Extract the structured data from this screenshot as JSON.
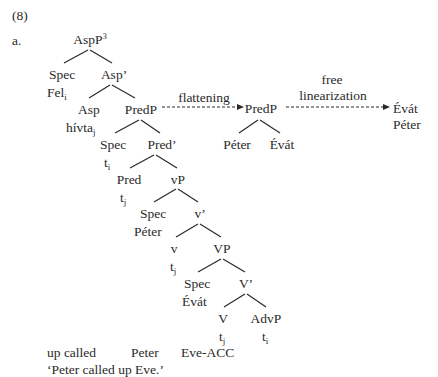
{
  "example": {
    "number": "(8)",
    "sub_label": "a."
  },
  "tree": {
    "root": {
      "label": "AspP",
      "sup": "3"
    },
    "spec1": {
      "label": "Spec",
      "filler": "Fel",
      "filler_sub": "i"
    },
    "asp_bar": {
      "label": "Asp’"
    },
    "asp": {
      "label": "Asp",
      "filler": "hívta",
      "filler_sub": "j"
    },
    "predp": {
      "label": "PredP"
    },
    "spec2": {
      "label": "Spec",
      "filler": "t",
      "filler_sub": "i"
    },
    "pred_bar": {
      "label": "Pred’"
    },
    "pred": {
      "label": "Pred",
      "filler": "t",
      "filler_sub": "j"
    },
    "vp_small": {
      "label": "vP"
    },
    "spec3": {
      "label": "Spec",
      "filler": "Péter"
    },
    "v_bar": {
      "label": "v’"
    },
    "v": {
      "label": "v",
      "filler": "t",
      "filler_sub": "j"
    },
    "vp": {
      "label": "VP"
    },
    "spec4": {
      "label": "Spec",
      "filler": "Évát"
    },
    "V_bar": {
      "label": "V’"
    },
    "V": {
      "label": "V",
      "filler": "t",
      "filler_sub": "j"
    },
    "advp": {
      "label": "AdvP",
      "filler": "t",
      "filler_sub": "i"
    }
  },
  "flattening": {
    "arrow_label": "flattening",
    "node": "PredP",
    "children": [
      "Péter",
      "Évát"
    ]
  },
  "linearization": {
    "arrow_label_line1": "free",
    "arrow_label_line2": "linearization",
    "output": [
      "Évát",
      "Péter"
    ]
  },
  "gloss": {
    "words": [
      "up called",
      "Peter",
      "Eve-ACC"
    ],
    "translation": "‘Peter called up Eve.’"
  }
}
